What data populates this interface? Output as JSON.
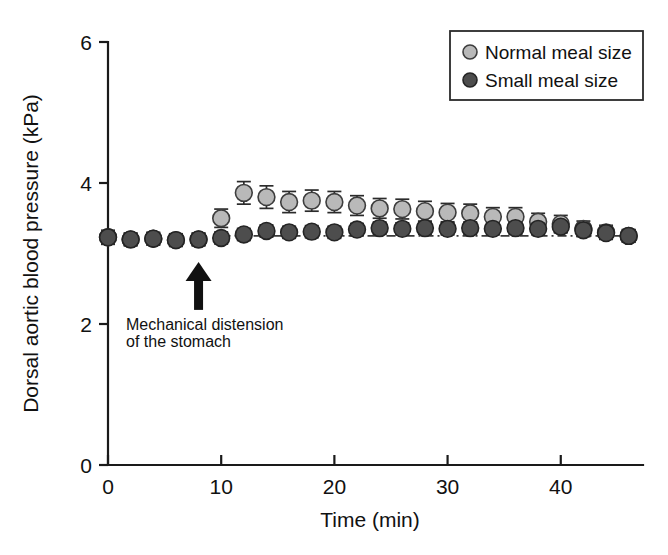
{
  "chart_data": {
    "type": "scatter",
    "title": "",
    "xlabel": "Time (min)",
    "ylabel": "Dorsal aortic blood pressure (kPa)",
    "xlim": [
      0,
      47
    ],
    "ylim": [
      0,
      6
    ],
    "xticks": [
      0,
      10,
      20,
      30,
      40
    ],
    "yticks": [
      0,
      2,
      4,
      6
    ],
    "xtick_labels": [
      "0",
      "10",
      "20",
      "30",
      "40"
    ],
    "ytick_labels": [
      "0",
      "2",
      "4",
      "6"
    ],
    "grid": false,
    "legend_position": "top-right",
    "x": [
      0,
      2,
      4,
      6,
      8,
      10,
      12,
      14,
      16,
      18,
      20,
      22,
      24,
      26,
      28,
      30,
      32,
      34,
      36,
      38,
      40,
      42,
      44,
      46
    ],
    "series": [
      {
        "name": "Normal meal size",
        "marker": "filled-circle-light",
        "color": "#b9b9b9",
        "values": [
          3.23,
          3.2,
          3.21,
          3.19,
          3.2,
          3.5,
          3.86,
          3.8,
          3.73,
          3.75,
          3.73,
          3.68,
          3.64,
          3.63,
          3.6,
          3.58,
          3.57,
          3.52,
          3.52,
          3.45,
          3.42,
          3.35,
          3.3,
          3.25
        ],
        "errors": [
          0.1,
          0.09,
          0.09,
          0.09,
          0.09,
          0.13,
          0.16,
          0.16,
          0.15,
          0.15,
          0.15,
          0.14,
          0.14,
          0.14,
          0.14,
          0.13,
          0.13,
          0.13,
          0.13,
          0.12,
          0.12,
          0.11,
          0.1,
          0.09
        ]
      },
      {
        "name": "Small meal size",
        "marker": "filled-circle-dark",
        "color": "#4d4d4d",
        "values": [
          3.23,
          3.2,
          3.21,
          3.19,
          3.2,
          3.22,
          3.27,
          3.32,
          3.3,
          3.31,
          3.3,
          3.34,
          3.36,
          3.35,
          3.36,
          3.35,
          3.36,
          3.35,
          3.36,
          3.35,
          3.38,
          3.33,
          3.29,
          3.25
        ]
      }
    ],
    "reference_line": {
      "style": "dash-dot",
      "y": 3.25
    },
    "annotations": [
      {
        "name": "mechanical-distension",
        "text_line1": "Mechanical distension",
        "text_line2": "of the stomach",
        "arrow_x": 8,
        "arrow_from_y": 2.2,
        "arrow_to_y": 2.88
      }
    ]
  },
  "legend": {
    "items": [
      {
        "label": "Normal meal size",
        "marker": "filled-circle-light"
      },
      {
        "label": "Small meal size",
        "marker": "filled-circle-dark"
      }
    ]
  },
  "axes": {
    "y_title": "Dorsal aortic blood pressure (kPa)",
    "x_title": "Time (min)"
  }
}
